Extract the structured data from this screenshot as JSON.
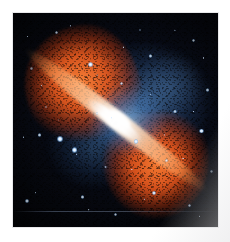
{
  "figure": {
    "kind": "astronomical-composite-photograph",
    "orientation_note": "jet axis runs from upper-left to lower-right",
    "caption": "",
    "alt_text": "Composite astronomical image of a radio galaxy: two large mottled orange radio lobes extend to the upper left and lower right of a brilliant white core, surrounded by a blue glow and a field of blue-white stars on a black sky."
  },
  "mount": {
    "background_color": "#ffffff",
    "photo_inset_px": {
      "left": 13,
      "top": 13,
      "right": 12,
      "bottom": 15
    }
  },
  "palette": {
    "sky_black": "#05060b",
    "deep_blue": "#0a1020",
    "halo_blue": "#5c96d7",
    "core_white": "#ffffff",
    "lobe_orange_bright": "#ff8237",
    "lobe_orange_mid": "#f05c1e",
    "lobe_orange_deep": "#c43a0e",
    "star_blue_white": "#cfe6ff"
  },
  "features": [
    {
      "name": "northwest-radio-lobe",
      "color": "#f05c1e",
      "position": "upper-left"
    },
    {
      "name": "southeast-radio-lobe",
      "color": "#f05c1e",
      "position": "lower-right"
    },
    {
      "name": "galactic-core",
      "color": "#ffffff",
      "position": "center"
    },
    {
      "name": "jet-axis",
      "color": "#ffcba0",
      "position": "center diagonal"
    },
    {
      "name": "blue-emission-halo",
      "color": "#5c96d7",
      "position": "center to upper-right"
    },
    {
      "name": "starfield",
      "color": "#cfe6ff",
      "position": "full frame"
    }
  ],
  "bright_stars": [
    {
      "id": "star-1",
      "x_pct": 38,
      "y_pct": 24,
      "size_px": 5.0,
      "brightness": "bright"
    },
    {
      "id": "star-2",
      "x_pct": 67,
      "y_pct": 20,
      "size_px": 3.6,
      "brightness": "medium"
    },
    {
      "id": "star-3",
      "x_pct": 21,
      "y_pct": 9,
      "size_px": 3.0,
      "brightness": "medium"
    },
    {
      "id": "star-4",
      "x_pct": 88,
      "y_pct": 13,
      "size_px": 2.8,
      "brightness": "medium"
    },
    {
      "id": "star-5",
      "x_pct": 95,
      "y_pct": 36,
      "size_px": 3.2,
      "brightness": "medium"
    },
    {
      "id": "star-6",
      "x_pct": 23,
      "y_pct": 59,
      "size_px": 6.0,
      "brightness": "bright"
    },
    {
      "id": "star-7",
      "x_pct": 30,
      "y_pct": 64,
      "size_px": 5.2,
      "brightness": "bright"
    },
    {
      "id": "star-8",
      "x_pct": 13,
      "y_pct": 57,
      "size_px": 3.4,
      "brightness": "medium"
    },
    {
      "id": "star-9",
      "x_pct": 60,
      "y_pct": 60,
      "size_px": 4.6,
      "brightness": "bright"
    },
    {
      "id": "star-10",
      "x_pct": 79,
      "y_pct": 46,
      "size_px": 3.8,
      "brightness": "medium"
    },
    {
      "id": "star-11",
      "x_pct": 92,
      "y_pct": 55,
      "size_px": 4.4,
      "brightness": "bright"
    },
    {
      "id": "star-12",
      "x_pct": 75,
      "y_pct": 69,
      "size_px": 3.4,
      "brightness": "medium"
    },
    {
      "id": "star-13",
      "x_pct": 69,
      "y_pct": 84,
      "size_px": 4.0,
      "brightness": "bright"
    },
    {
      "id": "star-14",
      "x_pct": 34,
      "y_pct": 86,
      "size_px": 3.6,
      "brightness": "medium"
    },
    {
      "id": "star-15",
      "x_pct": 7,
      "y_pct": 88,
      "size_px": 4.2,
      "brightness": "bright"
    },
    {
      "id": "star-16",
      "x_pct": 50,
      "y_pct": 94,
      "size_px": 3.0,
      "brightness": "medium"
    },
    {
      "id": "star-17",
      "x_pct": 53,
      "y_pct": 33,
      "size_px": 3.4,
      "brightness": "medium"
    },
    {
      "id": "star-18",
      "x_pct": 16,
      "y_pct": 44,
      "size_px": 2.6,
      "brightness": "faint"
    },
    {
      "id": "star-19",
      "x_pct": 45,
      "y_pct": 72,
      "size_px": 2.8,
      "brightness": "faint"
    },
    {
      "id": "star-20",
      "x_pct": 86,
      "y_pct": 90,
      "size_px": 3.2,
      "brightness": "medium"
    },
    {
      "id": "star-21",
      "x_pct": 62,
      "y_pct": 8,
      "size_px": 2.6,
      "brightness": "faint"
    },
    {
      "id": "star-22",
      "x_pct": 9,
      "y_pct": 26,
      "size_px": 2.4,
      "brightness": "faint"
    },
    {
      "id": "star-23",
      "x_pct": 41,
      "y_pct": 47,
      "size_px": 2.4,
      "brightness": "faint"
    },
    {
      "id": "star-24",
      "x_pct": 97,
      "y_pct": 74,
      "size_px": 2.8,
      "brightness": "faint"
    }
  ]
}
